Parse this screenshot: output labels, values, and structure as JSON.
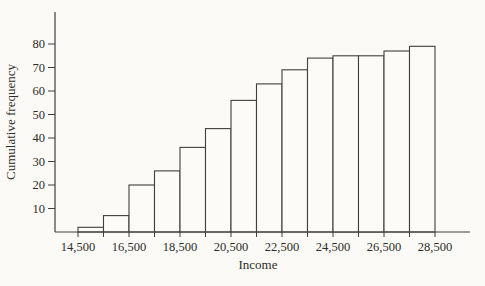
{
  "figure": {
    "background": "#fbfaf6"
  },
  "chart_data": {
    "type": "bar",
    "subtype": "cumulative-frequency-histogram",
    "title": "",
    "xlabel": "Income",
    "ylabel": "Cumulative frequency",
    "class_width": 1000,
    "class_boundaries": [
      14500,
      15500,
      16500,
      17500,
      18500,
      19500,
      20500,
      21500,
      22500,
      23500,
      24500,
      25500,
      26500,
      27500,
      28500
    ],
    "categories": [
      "14,500-15,500",
      "15,500-16,500",
      "16,500-17,500",
      "17,500-18,500",
      "18,500-19,500",
      "19,500-20,500",
      "20,500-21,500",
      "21,500-22,500",
      "22,500-23,500",
      "23,500-24,500",
      "24,500-25,500",
      "25,500-26,500",
      "26,500-27,500",
      "27,500-28,500"
    ],
    "values": [
      2,
      7,
      20,
      26,
      36,
      44,
      56,
      63,
      69,
      74,
      75,
      75,
      77,
      79
    ],
    "x_tick_positions": [
      14500,
      16500,
      18500,
      20500,
      22500,
      24500,
      26500,
      28500
    ],
    "x_tick_labels": [
      "14,500",
      "16,500",
      "18,500",
      "20,500",
      "22,500",
      "24,500",
      "26,500",
      "28,500"
    ],
    "y_ticks": [
      10,
      20,
      30,
      40,
      50,
      60,
      70,
      80
    ],
    "ylim": [
      0,
      92
    ],
    "xlim": [
      13600,
      29900
    ],
    "grid": false,
    "legend": null,
    "bar_fill": "#fcfbf8",
    "line_color": "#413f3b",
    "text_color": "#2e2c28"
  }
}
